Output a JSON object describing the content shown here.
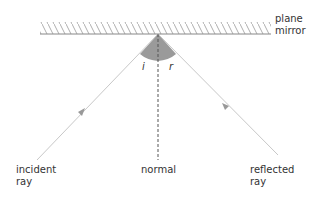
{
  "diagram": {
    "labels": {
      "mirror": "plane\nmirror",
      "incident": "incident\nray",
      "normal": "normal",
      "reflected": "reflected\nray",
      "angle_i": "i",
      "angle_r": "r"
    },
    "colors": {
      "ray": "#c8c8c8",
      "arrow": "#999999",
      "mirror_line": "#888888",
      "hatch": "#999999",
      "angle_fill": "#9a9a9a",
      "normal": "#555555",
      "text": "#333333"
    }
  }
}
